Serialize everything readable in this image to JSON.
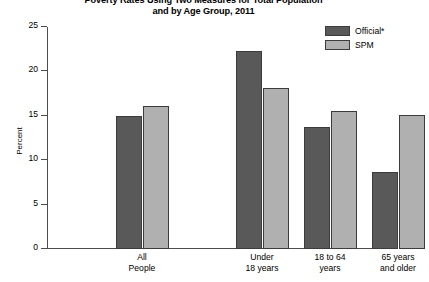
{
  "chart_data": {
    "type": "bar",
    "title": "Poverty Rates Using Two Measures for Total Population and by Age Group, 2011",
    "title_line1": "Poverty Rates Using Two Measures for Total Population",
    "title_line2": "and by Age Group, 2011",
    "xlabel": "",
    "ylabel": "Percent",
    "ylim": [
      0,
      25
    ],
    "yticks": [
      0,
      5,
      10,
      15,
      20,
      25
    ],
    "ytick_labels": [
      "0",
      "5",
      "10",
      "15",
      "20",
      "25"
    ],
    "grid": false,
    "legend_position": "top-right",
    "categories": [
      "All People",
      "Under 18 years",
      "18 to 64 years",
      "65 years and older"
    ],
    "category_lines": [
      [
        "All",
        "People"
      ],
      [
        "Under",
        "18 years"
      ],
      [
        "18 to 64",
        "years"
      ],
      [
        "65 years",
        "and older"
      ]
    ],
    "series": [
      {
        "name": "Official*",
        "color": "#595959",
        "values": [
          15.0,
          22.3,
          13.7,
          8.7
        ]
      },
      {
        "name": "SPM",
        "color": "#b0b0b0",
        "values": [
          16.1,
          18.1,
          15.5,
          15.1
        ]
      }
    ]
  },
  "legend": {
    "items": [
      {
        "label": "Official*"
      },
      {
        "label": "SPM"
      }
    ]
  }
}
